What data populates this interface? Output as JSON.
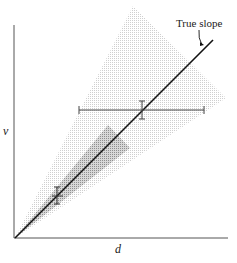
{
  "diagram": {
    "annotation": "True slope",
    "x_label": "d",
    "y_label": "v",
    "elements": [
      {
        "type": "axis",
        "name": "x-axis",
        "label": "d"
      },
      {
        "type": "axis",
        "name": "y-axis",
        "label": "v"
      },
      {
        "type": "line",
        "name": "true-slope-line",
        "label": "True slope"
      },
      {
        "type": "cone",
        "name": "wide-uncertainty-cone",
        "shade": "light"
      },
      {
        "type": "cone",
        "name": "narrow-uncertainty-cone",
        "shade": "dark"
      },
      {
        "type": "point",
        "name": "near-data-point",
        "error_bars": "small"
      },
      {
        "type": "point",
        "name": "far-data-point",
        "error_bars": "large horizontal"
      }
    ]
  },
  "colors": {
    "light_cone": "#e6e6e6",
    "dark_cone": "#bdbdbd",
    "line": "#111111",
    "axis": "#555555"
  }
}
